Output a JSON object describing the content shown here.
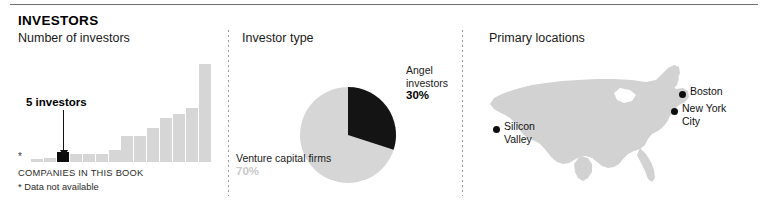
{
  "header": {
    "title": "INVESTORS"
  },
  "panels": {
    "bar": {
      "subtitle": "Number of investors",
      "callout": "5 investors",
      "asterisk": "*",
      "footnote_caps": "COMPANIES IN THIS BOOK",
      "footnote_note": "* Data not available"
    },
    "pie": {
      "subtitle": "Investor type",
      "angel_name": "Angel\ninvestors",
      "angel_pct": "30%",
      "vc_name": "Venture\ncapital firms",
      "vc_pct": "70%"
    },
    "map": {
      "subtitle": "Primary locations",
      "pins": [
        {
          "label": "Silicon\nValley"
        },
        {
          "label": "Boston"
        },
        {
          "label": "New York\nCity"
        }
      ]
    }
  },
  "chart_data": [
    {
      "type": "bar",
      "title": "Number of investors",
      "xlabel": "COMPANIES IN THIS BOOK",
      "ylabel": "",
      "grid": false,
      "legend": "none",
      "categories": [
        "*",
        "c2",
        "c3",
        "c4",
        "c5",
        "c6",
        "c7",
        "c8",
        "c9",
        "c10",
        "c11",
        "c12",
        "c13",
        "c14",
        "c15"
      ],
      "values": [
        0,
        1,
        2,
        5,
        4,
        4,
        4,
        6,
        13,
        13,
        17,
        22,
        24,
        27,
        49
      ],
      "highlight_index": 3,
      "highlight_value": 5,
      "highlight_label": "5 investors",
      "ylim": [
        0,
        50
      ],
      "note": "* Data not available"
    },
    {
      "type": "pie",
      "title": "Investor type",
      "labels": [
        "Angel investors",
        "Venture capital firms"
      ],
      "values": [
        30,
        70
      ],
      "colors": [
        "#141414",
        "#d6d6d6"
      ],
      "start_angle_deg": 0,
      "direction": "clockwise",
      "legend": "outside-labels"
    },
    {
      "type": "scatter",
      "title": "Primary locations",
      "basemap": "united-states",
      "points": [
        {
          "label": "Silicon Valley",
          "x": 0.15,
          "y": 0.52
        },
        {
          "label": "Boston",
          "x": 0.93,
          "y": 0.26
        },
        {
          "label": "New York City",
          "x": 0.9,
          "y": 0.38
        }
      ],
      "marker_color": "#0d0d0d",
      "land_color": "#d2d2d2"
    }
  ]
}
